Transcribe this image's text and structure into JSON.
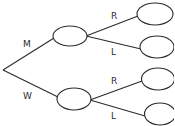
{
  "diagram": {
    "type": "tree",
    "root": {
      "x": 3,
      "y": 70
    },
    "colors": {
      "stroke": "#2b2b2b",
      "background": "#ffffff",
      "node_fill": "#ffffff"
    },
    "level1": [
      {
        "label": "M",
        "node": {
          "cx": 70,
          "cy": 36,
          "rx": 17,
          "ry": 10
        }
      },
      {
        "label": "W",
        "node": {
          "cx": 74,
          "cy": 99,
          "rx": 17,
          "ry": 11
        }
      }
    ],
    "level2": [
      {
        "parent": "M",
        "label": "R",
        "node": {
          "cx": 155,
          "cy": 14,
          "rx": 18,
          "ry": 11
        }
      },
      {
        "parent": "M",
        "label": "L",
        "node": {
          "cx": 157,
          "cy": 47,
          "rx": 17,
          "ry": 11
        }
      },
      {
        "parent": "W",
        "label": "R",
        "node": {
          "cx": 158,
          "cy": 79,
          "rx": 17,
          "ry": 11
        }
      },
      {
        "parent": "W",
        "label": "L",
        "node": {
          "cx": 160,
          "cy": 114,
          "rx": 16,
          "ry": 11
        }
      }
    ],
    "labels": {
      "m": "M",
      "w": "W",
      "m_r": "R",
      "m_l": "L",
      "w_r": "R",
      "w_l": "L"
    }
  }
}
